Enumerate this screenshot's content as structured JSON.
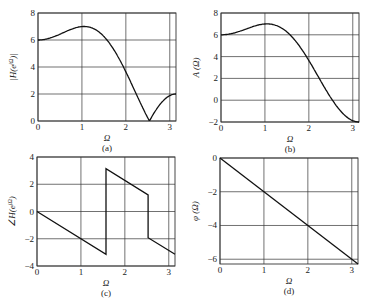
{
  "chart_data": [
    {
      "id": "a",
      "type": "line",
      "caption": "(a)",
      "xlabel": "Ω",
      "ylabel": "|H(e^jΩ)|",
      "xlim": [
        0,
        3.1416
      ],
      "ylim": [
        0,
        8
      ],
      "xticks": [
        0,
        1,
        2,
        3
      ],
      "yticks": [
        0,
        2,
        4,
        6,
        8
      ],
      "grid": true,
      "description": "|A(Ω)| where A(Ω)=4+4cosΩ−2cos2Ω",
      "x": [
        0,
        0.25,
        0.5,
        0.75,
        1.0,
        1.047,
        1.25,
        1.5,
        1.75,
        2.0,
        2.25,
        2.53,
        2.75,
        3.0,
        3.1416
      ],
      "y": [
        6.0,
        6.18,
        6.59,
        6.93,
        7.0,
        7.0,
        6.85,
        6.28,
        5.18,
        3.64,
        1.8,
        0.0,
        0.97,
        1.82,
        2.0
      ]
    },
    {
      "id": "b",
      "type": "line",
      "caption": "(b)",
      "xlabel": "Ω",
      "ylabel": "A(Ω)",
      "xlim": [
        0,
        3.1416
      ],
      "ylim": [
        -2,
        8
      ],
      "xticks": [
        0,
        1,
        2,
        3
      ],
      "yticks": [
        -2,
        0,
        2,
        4,
        6,
        8
      ],
      "grid": true,
      "x": [
        0,
        0.25,
        0.5,
        0.75,
        1.0,
        1.047,
        1.25,
        1.5,
        1.75,
        2.0,
        2.25,
        2.53,
        2.75,
        3.0,
        3.1416
      ],
      "y": [
        6.0,
        6.18,
        6.59,
        6.93,
        7.0,
        7.0,
        6.85,
        6.28,
        5.18,
        3.64,
        1.8,
        0.0,
        -0.97,
        -1.82,
        -2.0
      ]
    },
    {
      "id": "c",
      "type": "line",
      "caption": "(c)",
      "xlabel": "Ω",
      "ylabel": "∠H(e^jΩ)",
      "xlim": [
        0,
        3.1416
      ],
      "ylim": [
        -4,
        4
      ],
      "xticks": [
        0,
        1,
        2,
        3
      ],
      "yticks": [
        -4,
        -2,
        0,
        2,
        4
      ],
      "grid": true,
      "x": [
        0,
        1.5708,
        1.5708,
        2.53,
        2.53,
        3.1416
      ],
      "y": [
        0,
        -3.1416,
        3.1416,
        1.22,
        -1.92,
        -3.1416
      ]
    },
    {
      "id": "d",
      "type": "line",
      "caption": "(d)",
      "xlabel": "Ω",
      "ylabel": "φ(Ω)",
      "xlim": [
        0,
        3.1416
      ],
      "ylim": [
        -6.2832,
        0
      ],
      "xticks": [
        0,
        1,
        2,
        3
      ],
      "yticks": [
        -6,
        -4,
        -2,
        0
      ],
      "grid": true,
      "x": [
        0,
        3.1416
      ],
      "y": [
        0,
        -6.2832
      ]
    }
  ],
  "panels": {
    "a": {
      "caption": "(a)",
      "xlabel": "Ω",
      "ylabel_main": "|H(e",
      "ylabel_sup": "jΩ",
      "ylabel_end": ")|"
    },
    "b": {
      "caption": "(b)",
      "xlabel": "Ω",
      "ylabel": "A (Ω)"
    },
    "c": {
      "caption": "(c)",
      "xlabel": "Ω",
      "ylabel_main": "∠H(e",
      "ylabel_sup": "jΩ",
      "ylabel_end": ")"
    },
    "d": {
      "caption": "(d)",
      "xlabel": "Ω",
      "ylabel": "φ (Ω)"
    }
  },
  "colors": {
    "line": "#111111",
    "grid": "#333333",
    "frame": "#333333"
  }
}
